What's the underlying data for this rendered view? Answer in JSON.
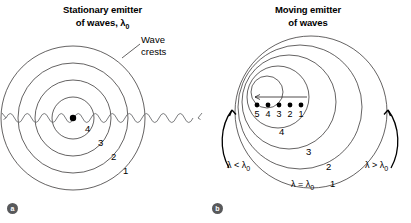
{
  "figure": {
    "type": "doppler-effect-diagram",
    "background_color": "#ffffff",
    "stroke_color": "#231f20",
    "badge_color": "#58595b"
  },
  "panel_a": {
    "badge": "a",
    "title_line1": "Stationary emitter",
    "title_line2_prefix": "of waves, ",
    "title_lambda": "λ",
    "title_lambda_sub": "0",
    "annotation": {
      "name": "wave-crests-callout",
      "line1": "Wave",
      "line2": "crests"
    },
    "emitter": {
      "name": "stationary-emitter-dot",
      "cx": 73,
      "cy": 118,
      "r": 3.2
    },
    "circles": [
      {
        "label": "1",
        "r": 72
      },
      {
        "label": "2",
        "r": 55
      },
      {
        "label": "3",
        "r": 38
      },
      {
        "label": "4",
        "r": 21
      }
    ],
    "ring_labels": [
      {
        "label": "1",
        "x": 123,
        "y": 171
      },
      {
        "label": "2",
        "x": 111,
        "y": 157
      },
      {
        "label": "3",
        "x": 98,
        "y": 143
      },
      {
        "label": "4",
        "x": 85,
        "y": 129
      }
    ],
    "wave_line": {
      "name": "sine-wave-ray",
      "y": 118,
      "x_start": 2,
      "x_end": 202,
      "amplitude": 5,
      "wavelength": 17
    }
  },
  "panel_b": {
    "badge": "b",
    "title_line1": "Moving emitter",
    "title_line2": "of waves",
    "circles": [
      {
        "label": "1",
        "cx": 106,
        "cy": 112,
        "r": 76
      },
      {
        "label": "2",
        "cx": 95,
        "cy": 107,
        "r": 62
      },
      {
        "label": "3",
        "cx": 84,
        "cy": 102,
        "r": 47
      },
      {
        "label": "4",
        "cx": 73,
        "cy": 97,
        "r": 31
      },
      {
        "label": "5",
        "cx": 62,
        "cy": 92,
        "r": 16
      }
    ],
    "ring_labels": [
      {
        "label": "1",
        "x": 125,
        "y": 184
      },
      {
        "label": "2",
        "x": 121,
        "y": 167
      },
      {
        "label": "3",
        "x": 101,
        "y": 152
      },
      {
        "label": "4",
        "x": 74,
        "y": 132
      }
    ],
    "emitter_positions": {
      "name": "emitter-position-dots",
      "y": 105,
      "dot_r": 2.4,
      "dots": [
        {
          "label": "5",
          "x": 52
        },
        {
          "label": "4",
          "x": 63
        },
        {
          "label": "3",
          "x": 74
        },
        {
          "label": "2",
          "x": 85
        },
        {
          "label": "1",
          "x": 96
        }
      ]
    },
    "motion_arrow": {
      "name": "emitter-motion-arrow",
      "x_tail": 102,
      "x_head": 50,
      "y": 97,
      "direction": "left"
    },
    "wavelength_labels": [
      {
        "name": "lambda-less-label",
        "text": "λ < λ",
        "sub": "0",
        "x": 22,
        "y": 163
      },
      {
        "name": "lambda-equal-label",
        "text": "λ = λ",
        "sub": "0",
        "x": 86,
        "y": 182
      },
      {
        "name": "lambda-greater-label",
        "text": "λ > λ",
        "sub": "0",
        "x": 163,
        "y": 163
      }
    ],
    "curved_arrows": [
      {
        "name": "left-observer-arrow",
        "side": "left"
      },
      {
        "name": "right-observer-arrow",
        "side": "right"
      }
    ]
  }
}
